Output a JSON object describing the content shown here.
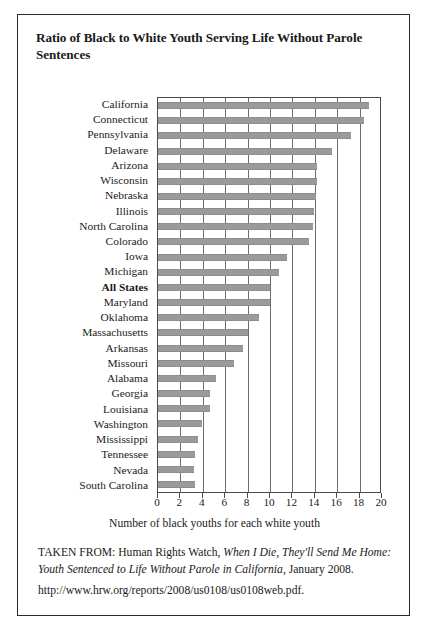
{
  "figure": {
    "title": "Ratio of Black to White Youth Serving Life Without Parole Sentences",
    "attribution": {
      "lead": "TAKEN FROM: Human Rights Watch, ",
      "report_title_italic": "When I Die, They'll Send Me Home: Youth Sentenced to Life Without Parole in California",
      "trailing": ", January 2008.",
      "url": "http://www.hrw.org/reports/2008/us0108/us0108web.pdf."
    }
  },
  "chart_data": {
    "type": "bar",
    "orientation": "horizontal",
    "title": "Ratio of Black to White Youth Serving Life Without Parole Sentences",
    "xlabel": "Number of black youths for each white youth",
    "ylabel": "",
    "xlim": [
      0,
      20
    ],
    "xticks": [
      0,
      2,
      4,
      6,
      8,
      10,
      12,
      14,
      16,
      18,
      20
    ],
    "grid": true,
    "legend": null,
    "bar_color": "#9a9a9a",
    "highlight_category": "All States",
    "categories": [
      "California",
      "Connecticut",
      "Pennsylvania",
      "Delaware",
      "Arizona",
      "Wisconsin",
      "Nebraska",
      "Illinois",
      "North Carolina",
      "Colorado",
      "Iowa",
      "Michigan",
      "All States",
      "Maryland",
      "Oklahoma",
      "Massachusetts",
      "Arkansas",
      "Missouri",
      "Alabama",
      "Georgia",
      "Louisiana",
      "Washington",
      "Mississippi",
      "Tennessee",
      "Nevada",
      "South Carolina"
    ],
    "values": [
      18.8,
      18.4,
      17.2,
      15.5,
      14.2,
      14.2,
      14.1,
      13.9,
      13.8,
      13.5,
      11.5,
      10.8,
      10.0,
      10.0,
      9.0,
      8.0,
      7.6,
      6.8,
      5.2,
      4.6,
      4.6,
      3.9,
      3.6,
      3.3,
      3.2,
      3.3
    ]
  }
}
